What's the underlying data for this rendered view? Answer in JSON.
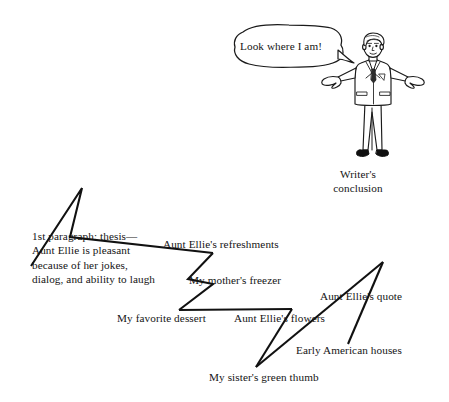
{
  "figure": {
    "type": "zigzag-outline-diagram",
    "character": {
      "name": "writer-character",
      "pose": "arms-outstretched",
      "speech_bubble": {
        "text": "Look where I am!"
      },
      "caption": "Writer's\nconclusion",
      "caption_line1": "Writer's",
      "caption_line2": "conclusion"
    },
    "ink_color": "#111111",
    "paper_color": "#ffffff"
  },
  "labels": {
    "thesis": "1st paragraph: thesis—Aunt Ellie is pleasant because of her jokes, dialog, and ability to laugh",
    "refreshments": "Aunt Ellie's refreshments",
    "freezer": "My mother's freezer",
    "dessert": "My favorite dessert",
    "flowers": "Aunt Ellie's flowers",
    "quote": "Aunt Ellie's quote",
    "houses": "Early American houses",
    "thumb": "My sister's green thumb",
    "conclusion_line1": "Writer's",
    "conclusion_line2": "conclusion",
    "bubble": "Look where I am!"
  }
}
